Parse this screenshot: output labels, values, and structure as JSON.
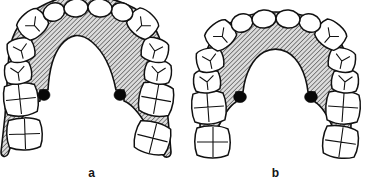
{
  "figure": {
    "type": "anatomical-diagram",
    "panel_count": 2,
    "colors": {
      "outline": "#111111",
      "tooth_fill": "#ffffff",
      "palate_hatch_line": "#3a3a3a",
      "palate_hatch_background": "#d8d8d8",
      "marker_black": "#080808",
      "label_text": "#151515",
      "page_background": "#ffffff"
    },
    "hatch": {
      "name": "diagonal-hatch",
      "angle_deg": 45,
      "spacing_px": 3,
      "stroke_width_px": 1.1
    }
  },
  "panels": [
    {
      "id": "a",
      "label": "a",
      "arch_form": "narrow deep V-shaped palatal vault",
      "vault": {
        "width_px": 72,
        "depth_px": 96,
        "apex_y_px": 22,
        "shape": "U-narrow"
      },
      "teeth_total": 14,
      "markers": [
        {
          "name": "palatal-marker-left",
          "cx": 61,
          "cy": 96,
          "rx": 6.0,
          "ry": 5.4
        },
        {
          "name": "palatal-marker-right",
          "cx": 124,
          "cy": 96,
          "rx": 6.0,
          "ry": 5.4
        }
      ],
      "teeth": [
        {
          "name": "incisor-upper-left-central",
          "group": "incisor",
          "side": "left",
          "cx": 76,
          "cy": 8,
          "rx": 12,
          "ry": 9,
          "rot": -6,
          "marking": "none"
        },
        {
          "name": "incisor-upper-right-central",
          "group": "incisor",
          "side": "right",
          "cx": 100,
          "cy": 8,
          "rx": 12,
          "ry": 9,
          "rot": 6,
          "marking": "none"
        },
        {
          "name": "incisor-upper-left-lateral",
          "group": "incisor",
          "side": "left",
          "cx": 54,
          "cy": 12,
          "rx": 11,
          "ry": 9,
          "rot": -22,
          "marking": "none"
        },
        {
          "name": "incisor-upper-right-lateral",
          "group": "incisor",
          "side": "right",
          "cx": 122,
          "cy": 12,
          "rx": 11,
          "ry": 9,
          "rot": 22,
          "marking": "none"
        },
        {
          "name": "canine-upper-left",
          "group": "canine",
          "side": "left",
          "cx": 33,
          "cy": 24,
          "rx": 13,
          "ry": 12,
          "rot": -42,
          "marking": "cusp-y"
        },
        {
          "name": "canine-upper-right",
          "group": "canine",
          "side": "right",
          "cx": 143,
          "cy": 24,
          "rx": 13,
          "ry": 12,
          "rot": 42,
          "marking": "cusp-y"
        },
        {
          "name": "premolar-upper-left-first",
          "group": "premolar",
          "side": "left",
          "cx": 21,
          "cy": 50,
          "rx": 12,
          "ry": 11,
          "rot": -14,
          "marking": "cusp-y"
        },
        {
          "name": "premolar-upper-right-first",
          "group": "premolar",
          "side": "right",
          "cx": 155,
          "cy": 50,
          "rx": 12,
          "ry": 11,
          "rot": 14,
          "marking": "cusp-y"
        },
        {
          "name": "premolar-upper-left-second",
          "group": "premolar",
          "side": "left",
          "cx": 18,
          "cy": 72,
          "rx": 12,
          "ry": 11,
          "rot": -8,
          "marking": "cusp-y"
        },
        {
          "name": "premolar-upper-right-second",
          "group": "premolar",
          "side": "right",
          "cx": 158,
          "cy": 72,
          "rx": 12,
          "ry": 11,
          "rot": 8,
          "marking": "cusp-y"
        },
        {
          "name": "molar-upper-left-first",
          "group": "molar",
          "side": "left",
          "cx": 21,
          "cy": 100,
          "rx": 16,
          "ry": 15,
          "rot": -6,
          "marking": "cross-groove"
        },
        {
          "name": "molar-upper-right-first",
          "group": "molar",
          "side": "right",
          "cx": 156,
          "cy": 100,
          "rx": 16,
          "ry": 15,
          "rot": 10,
          "marking": "cross-groove"
        },
        {
          "name": "molar-upper-left-second",
          "group": "molar",
          "side": "left",
          "cx": 25,
          "cy": 134,
          "rx": 16,
          "ry": 15,
          "rot": -2,
          "marking": "cross-groove"
        },
        {
          "name": "molar-upper-right-second",
          "group": "molar",
          "side": "right",
          "cx": 152,
          "cy": 138,
          "rx": 16,
          "ry": 15,
          "rot": 14,
          "marking": "cross-groove"
        }
      ]
    },
    {
      "id": "b",
      "label": "b",
      "arch_form": "wide rounded palatal vault",
      "vault": {
        "width_px": 88,
        "depth_px": 86,
        "apex_y_px": 40,
        "shape": "U-wide"
      },
      "teeth_total": 14,
      "markers": [
        {
          "name": "palatal-marker-left",
          "cx": 56,
          "cy": 98,
          "rx": 6.4,
          "ry": 5.6
        },
        {
          "name": "palatal-marker-right",
          "cx": 127,
          "cy": 98,
          "rx": 6.4,
          "ry": 5.6
        }
      ],
      "teeth": [
        {
          "name": "incisor-upper-left-central",
          "group": "incisor",
          "side": "left",
          "cx": 80,
          "cy": 19,
          "rx": 12,
          "ry": 9,
          "rot": -5,
          "marking": "none"
        },
        {
          "name": "incisor-upper-right-central",
          "group": "incisor",
          "side": "right",
          "cx": 104,
          "cy": 19,
          "rx": 12,
          "ry": 9,
          "rot": 5,
          "marking": "none"
        },
        {
          "name": "incisor-upper-left-lateral",
          "group": "incisor",
          "side": "left",
          "cx": 58,
          "cy": 23,
          "rx": 11,
          "ry": 9,
          "rot": -20,
          "marking": "none"
        },
        {
          "name": "incisor-upper-right-lateral",
          "group": "incisor",
          "side": "right",
          "cx": 126,
          "cy": 23,
          "rx": 11,
          "ry": 9,
          "rot": 20,
          "marking": "none"
        },
        {
          "name": "canine-upper-left",
          "group": "canine",
          "side": "left",
          "cx": 37,
          "cy": 35,
          "rx": 13,
          "ry": 12,
          "rot": -40,
          "marking": "cusp-y"
        },
        {
          "name": "canine-upper-right",
          "group": "canine",
          "side": "right",
          "cx": 147,
          "cy": 35,
          "rx": 13,
          "ry": 12,
          "rot": 40,
          "marking": "cusp-y"
        },
        {
          "name": "premolar-upper-left-first",
          "group": "premolar",
          "side": "left",
          "cx": 26,
          "cy": 60,
          "rx": 12,
          "ry": 11,
          "rot": -12,
          "marking": "cusp-y"
        },
        {
          "name": "premolar-upper-right-first",
          "group": "premolar",
          "side": "right",
          "cx": 158,
          "cy": 60,
          "rx": 12,
          "ry": 11,
          "rot": 12,
          "marking": "cusp-y"
        },
        {
          "name": "premolar-upper-left-second",
          "group": "premolar",
          "side": "left",
          "cx": 23,
          "cy": 81,
          "rx": 12,
          "ry": 11,
          "rot": -6,
          "marking": "cusp-y"
        },
        {
          "name": "premolar-upper-right-second",
          "group": "premolar",
          "side": "right",
          "cx": 161,
          "cy": 81,
          "rx": 12,
          "ry": 11,
          "rot": 6,
          "marking": "cusp-y"
        },
        {
          "name": "molar-upper-left-first",
          "group": "molar",
          "side": "left",
          "cx": 25,
          "cy": 108,
          "rx": 16,
          "ry": 15,
          "rot": -4,
          "marking": "cross-groove"
        },
        {
          "name": "molar-upper-right-first",
          "group": "molar",
          "side": "right",
          "cx": 159,
          "cy": 108,
          "rx": 16,
          "ry": 15,
          "rot": 4,
          "marking": "cross-groove"
        },
        {
          "name": "molar-upper-left-second",
          "group": "molar",
          "side": "left",
          "cx": 29,
          "cy": 142,
          "rx": 16,
          "ry": 15,
          "rot": 0,
          "marking": "cross-groove"
        },
        {
          "name": "molar-upper-right-second",
          "group": "molar",
          "side": "right",
          "cx": 156,
          "cy": 142,
          "rx": 16,
          "ry": 15,
          "rot": 8,
          "marking": "cross-groove"
        }
      ]
    }
  ]
}
